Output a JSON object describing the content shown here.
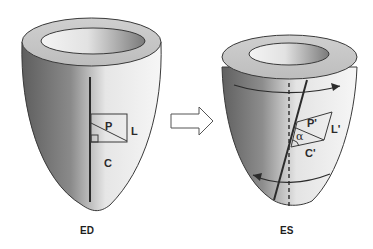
{
  "diagram": {
    "colors": {
      "background": "#ffffff",
      "outline": "#333333",
      "shade_dark": "#6e6e6e",
      "shade_light": "#f2f2f2",
      "line": "#2b2b2b"
    },
    "left_panel": {
      "caption": "ED",
      "labels": {
        "p": "P",
        "l": "L",
        "c": "C"
      },
      "icons": [
        "right-angle-marker-icon"
      ]
    },
    "arrow": {
      "icon": "right-arrow-icon"
    },
    "right_panel": {
      "caption": "ES",
      "labels": {
        "p": "P'",
        "l": "L'",
        "c": "C'",
        "alpha": "α"
      },
      "icons": [
        "rotation-arrow-top-icon",
        "rotation-arrow-bottom-icon"
      ]
    }
  }
}
